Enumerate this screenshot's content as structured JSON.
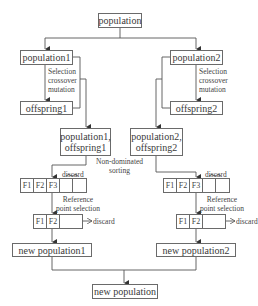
{
  "diagram": {
    "top": "population",
    "left": {
      "population": "population1",
      "operators": [
        "Selection",
        "crossover",
        "mutation"
      ],
      "offspring": "offspring1",
      "combined": [
        "population1,",
        "offspring1"
      ],
      "discard_top": "discard",
      "fronts1": [
        "F1",
        "F2",
        "F3",
        "",
        ""
      ],
      "ref_label": [
        "Reference",
        "point selection"
      ],
      "fronts2": [
        "F1",
        "F2",
        ""
      ],
      "discard_side": "discard",
      "new_population": "new population1"
    },
    "right": {
      "population": "population2",
      "operators": [
        "Selection",
        "crossover",
        "mutation"
      ],
      "offspring": "offspring2",
      "combined": [
        "population2,",
        "offspring2"
      ],
      "discard_top": "discard",
      "fronts1": [
        "F1",
        "F2",
        "F3",
        "",
        ""
      ],
      "ref_label": [
        "Reference",
        "point selection"
      ],
      "fronts2": [
        "F1",
        "F2",
        ""
      ],
      "discard_side": "discard",
      "new_population": "new population2"
    },
    "sorting_label": [
      "Non-dominated",
      "sorting"
    ],
    "bottom": "new population"
  }
}
